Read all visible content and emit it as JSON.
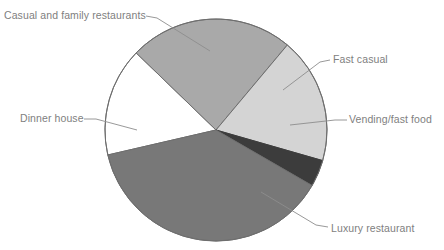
{
  "chart_data": {
    "type": "pie",
    "title": "",
    "subtitle": "",
    "xlabel": "",
    "ylabel": "",
    "grid": false,
    "legend_position": "none",
    "labels_position": "outside-with-leader-lines",
    "total_degrees": 360,
    "categories": [
      "Casual and family restaurants",
      "Fast casual",
      "Vending/fast food",
      "Luxury restaurant",
      "Dinner house"
    ],
    "values": [
      24,
      18,
      4,
      38,
      16
    ],
    "slices": [
      {
        "label": "Casual and family restaurants",
        "value": 24,
        "degrees": 86,
        "start_angle_deg": 314,
        "end_angle_deg": 40,
        "color": "#a9a9a9"
      },
      {
        "label": "Fast casual",
        "value": 18,
        "degrees": 66,
        "start_angle_deg": 40,
        "end_angle_deg": 106,
        "color": "#d4d4d4"
      },
      {
        "label": "Vending/fast food",
        "value": 4,
        "degrees": 14,
        "start_angle_deg": 106,
        "end_angle_deg": 120,
        "color": "#3c3c3c"
      },
      {
        "label": "Luxury restaurant",
        "value": 38,
        "degrees": 137,
        "start_angle_deg": 120,
        "end_angle_deg": 257,
        "color": "#787878"
      },
      {
        "label": "Dinner house",
        "value": 16,
        "degrees": 57,
        "start_angle_deg": 257,
        "end_angle_deg": 314,
        "color": "#ffffff"
      }
    ],
    "geometry": {
      "center_x": 216,
      "center_y": 130,
      "radius": 111
    },
    "stroke_color": "#6e6e6e",
    "label_color": "#808080"
  },
  "labels": {
    "casual_and_family_restaurants": "Casual and family restaurants",
    "dinner_house": "Dinner house",
    "fast_casual": "Fast casual",
    "vending_fast_food": "Vending/fast food",
    "luxury_restaurant": "Luxury restaurant"
  }
}
